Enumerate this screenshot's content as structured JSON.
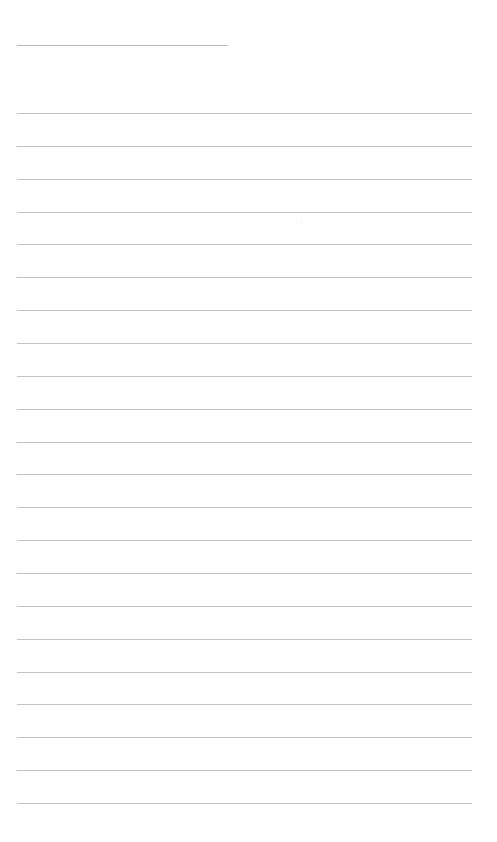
{
  "page": {
    "type": "lined-paper",
    "background_color": "#ffffff",
    "line_color": "#c2c2c2",
    "header_line": {
      "present": true
    },
    "ruled_lines": {
      "count": 22
    },
    "text": ""
  }
}
